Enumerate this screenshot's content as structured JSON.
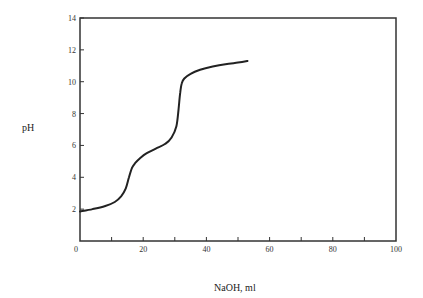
{
  "chart_data": {
    "type": "line",
    "title": "",
    "xlabel": "NaOH, ml",
    "ylabel": "pH",
    "xlim": [
      0,
      100
    ],
    "ylim": [
      0,
      14
    ],
    "x_ticks": [
      0,
      20,
      40,
      60,
      80,
      100
    ],
    "x_minor_ticks": [
      10,
      30,
      50,
      70,
      90
    ],
    "y_ticks": [
      2,
      4,
      6,
      8,
      10,
      12,
      14
    ],
    "y_tick_labels": [
      "2",
      "4",
      "6",
      "8",
      "10",
      "12",
      "14"
    ],
    "x_tick_labels": [
      "0",
      "20",
      "40",
      "60",
      "80",
      "100"
    ],
    "y_zero_label": "0",
    "grid": false,
    "legend": null,
    "series": [
      {
        "name": "titration curve",
        "color": "#222222",
        "x": [
          0,
          4,
          8,
          11,
          13,
          14.5,
          15.5,
          16.5,
          17.5,
          19,
          21,
          24,
          27,
          29,
          30.5,
          31.2,
          31.7,
          32.2,
          33,
          35,
          38,
          42,
          46,
          50,
          53
        ],
        "y": [
          1.85,
          2.0,
          2.2,
          2.45,
          2.8,
          3.3,
          4.0,
          4.6,
          4.9,
          5.2,
          5.5,
          5.8,
          6.1,
          6.5,
          7.2,
          8.3,
          9.3,
          9.9,
          10.2,
          10.5,
          10.75,
          10.95,
          11.1,
          11.2,
          11.3
        ]
      }
    ]
  }
}
